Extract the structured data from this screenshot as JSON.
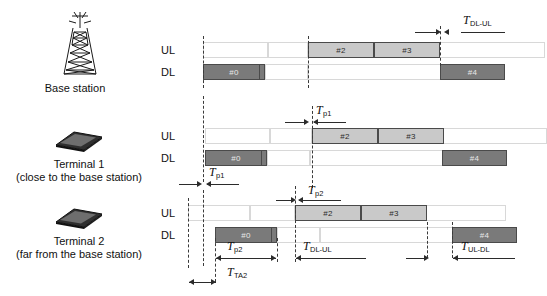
{
  "figure": {
    "type": "timing-diagram"
  },
  "entities": [
    {
      "id": "base-station",
      "icon": "cell-tower-icon",
      "name": "Base station",
      "sub": ""
    },
    {
      "id": "terminal-1",
      "icon": "mobile-phone-icon",
      "name": "Terminal 1",
      "sub": "(close to the base station)"
    },
    {
      "id": "terminal-2",
      "icon": "mobile-phone-icon",
      "name": "Terminal 2",
      "sub": "(far from the base station)"
    }
  ],
  "row_labels": {
    "uplink": "UL",
    "downlink": "DL"
  },
  "blocks": {
    "base_station": {
      "ul": [
        {
          "label": "#2",
          "x": 308,
          "w": 66
        },
        {
          "label": "#3",
          "x": 374,
          "w": 66
        }
      ],
      "dl": [
        {
          "label": "#0",
          "x": 203,
          "w": 62,
          "divider": 55
        },
        {
          "label": "#4",
          "x": 440,
          "w": 65
        }
      ]
    },
    "terminal_1": {
      "ul": [
        {
          "label": "#2",
          "x": 312,
          "w": 66
        },
        {
          "label": "#3",
          "x": 378,
          "w": 66
        }
      ],
      "dl": [
        {
          "label": "#0",
          "x": 205,
          "w": 62,
          "divider": 55
        },
        {
          "label": "#4",
          "x": 442,
          "w": 65
        }
      ]
    },
    "terminal_2": {
      "ul": [
        {
          "label": "#2",
          "x": 295,
          "w": 66
        },
        {
          "label": "#3",
          "x": 361,
          "w": 66
        }
      ],
      "dl": [
        {
          "label": "#0",
          "x": 215,
          "w": 62,
          "divider": 55
        },
        {
          "label": "#4",
          "x": 452,
          "w": 65
        }
      ]
    }
  },
  "timing_labels": {
    "t_dl_ul_top": {
      "base": "T",
      "sub": "DL-UL"
    },
    "t_p1_upper": {
      "base": "T",
      "sub": "p1"
    },
    "t_p1_lower": {
      "base": "T",
      "sub": "p1"
    },
    "t_p2_upper": {
      "base": "T",
      "sub": "p2"
    },
    "t_p2_lower": {
      "base": "T",
      "sub": "p2"
    },
    "t_ta2": {
      "base": "T",
      "sub": "TA2"
    },
    "t_dl_ul_bottom": {
      "base": "T",
      "sub": "DL-UL"
    },
    "t_ul_dl_bottom": {
      "base": "T",
      "sub": "UL-DL"
    }
  },
  "colors": {
    "uplink_block": "#c9c9c9",
    "downlink_block": "#7a7a7a",
    "block_border": "#4a4a4a",
    "grid_cell_border": "#d8d8d8",
    "guide_line": "#3a3a3a",
    "arrow": "#2b2b2b"
  }
}
